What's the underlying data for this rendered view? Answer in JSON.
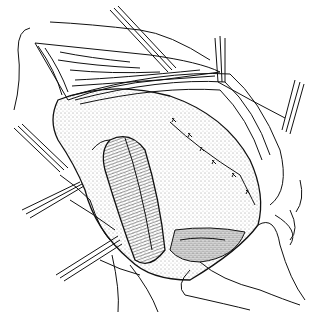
{
  "image": {
    "description": "Black and white surgical line illustration showing an exposed organ held open with retractors and sutures",
    "width": 324,
    "height": 312,
    "colors": {
      "ink": "#111111",
      "background": "#ffffff",
      "stipple": "#333333"
    },
    "elements": [
      {
        "name": "tissue-flap-top-left",
        "label": "retracted tissue flap"
      },
      {
        "name": "main-organ",
        "label": "stippled organ body"
      },
      {
        "name": "tubular-structure",
        "label": "dark tubular structure"
      },
      {
        "name": "suture-line",
        "label": "row of sutures",
        "count": 6
      },
      {
        "name": "retractor-top",
        "label": "upper retractors",
        "count": 2
      },
      {
        "name": "retractor-left",
        "label": "left retractors",
        "count": 2
      },
      {
        "name": "lower-hand",
        "label": "gloved hand/tissue at bottom right"
      }
    ]
  }
}
